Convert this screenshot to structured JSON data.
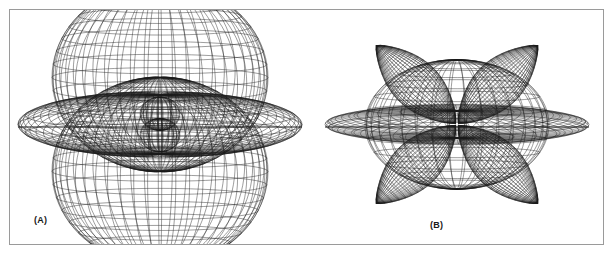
{
  "figure": {
    "background_color": "#ffffff",
    "frame_color": "#9a9a9a",
    "line_color": "#1a1a1a",
    "panels": [
      {
        "id": "A",
        "label": "(A)",
        "description": "3D wireframe surface plot of an angular distribution with two large vertical lobes (up and down along the polar axis), a pair of small inner spheroidal lobes near the origin, and a broad flattened equatorial disk lobe",
        "center_x": 150,
        "center_y": 117
      },
      {
        "id": "B",
        "label": "(B)",
        "description": "3D wireframe surface plot of an angular distribution with four large diagonal teardrop lobes arranged in a cloverleaf, a central oblate body, and a thin flattened equatorial disk",
        "center_x": 147,
        "center_y": 117
      }
    ]
  },
  "chart_data": [
    {
      "type": "line",
      "title": "(A)",
      "plot_kind": "3d-wireframe-polar-surface",
      "xlabel": "",
      "ylabel": "",
      "grid": false,
      "legend": null,
      "projection": {
        "kind": "axonometric",
        "elevation_deg": 12,
        "azimuth_deg": 0,
        "polar_axis": "vertical"
      },
      "mesh": {
        "meridians": 48,
        "parallels": 22
      },
      "components": [
        {
          "name": "upper-polar-lobe",
          "shape": "oblate-spheroid-lobe",
          "direction_deg": 90,
          "radius_x": 108,
          "radius_y": 96,
          "center_offset_y": -48
        },
        {
          "name": "lower-polar-lobe",
          "shape": "oblate-spheroid-lobe",
          "direction_deg": 270,
          "radius_x": 108,
          "radius_y": 96,
          "center_offset_y": 48
        },
        {
          "name": "equatorial-disk-lobe",
          "shape": "flattened-disk",
          "direction_deg": 0,
          "radius_x": 142,
          "radius_y": 30,
          "center_offset_y": 0
        },
        {
          "name": "inner-upper-lobe",
          "shape": "small-spheroid",
          "direction_deg": 90,
          "radius_x": 20,
          "radius_y": 17,
          "center_offset_y": -11
        },
        {
          "name": "inner-lower-lobe",
          "shape": "small-spheroid",
          "direction_deg": 270,
          "radius_x": 20,
          "radius_y": 17,
          "center_offset_y": 11
        }
      ]
    },
    {
      "type": "line",
      "title": "(B)",
      "plot_kind": "3d-wireframe-polar-surface",
      "xlabel": "",
      "ylabel": "",
      "grid": false,
      "legend": null,
      "projection": {
        "kind": "axonometric",
        "elevation_deg": 12,
        "azimuth_deg": 0,
        "polar_axis": "vertical"
      },
      "mesh": {
        "meridians": 40,
        "parallels": 18
      },
      "components": [
        {
          "name": "diagonal-lobe-upper-left",
          "shape": "teardrop-lobe",
          "direction_deg": 135,
          "length": 112,
          "width": 48
        },
        {
          "name": "diagonal-lobe-upper-right",
          "shape": "teardrop-lobe",
          "direction_deg": 45,
          "length": 112,
          "width": 48
        },
        {
          "name": "diagonal-lobe-lower-left",
          "shape": "teardrop-lobe",
          "direction_deg": 225,
          "length": 112,
          "width": 48
        },
        {
          "name": "diagonal-lobe-lower-right",
          "shape": "teardrop-lobe",
          "direction_deg": 315,
          "length": 112,
          "width": 48
        },
        {
          "name": "central-oblate-body",
          "shape": "oblate-spheroid",
          "direction_deg": 0,
          "radius_x": 92,
          "radius_y": 66
        },
        {
          "name": "equatorial-disk-lobe",
          "shape": "thin-disk",
          "direction_deg": 0,
          "radius_x": 132,
          "radius_y": 14
        }
      ]
    }
  ]
}
